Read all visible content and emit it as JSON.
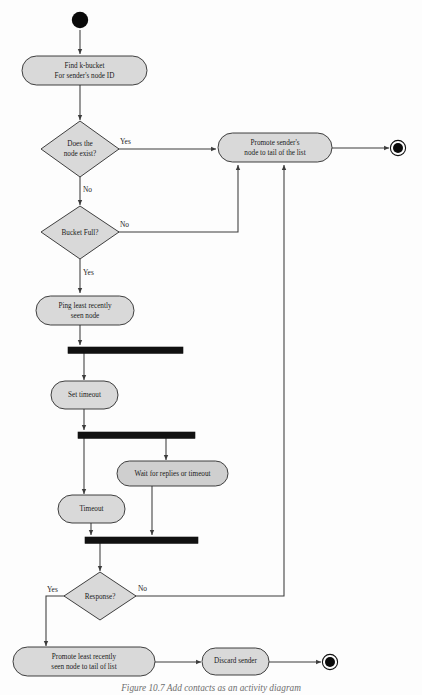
{
  "figure": {
    "caption": "Figure 10.7   Add contacts as an activity diagram"
  },
  "colors": {
    "node_fill": "#d9d9d9",
    "node_stroke": "#2b2b2b",
    "edge": "#3c3c3c",
    "bar": "#111111",
    "background": "#fdfdfd"
  },
  "nodes": {
    "start": {
      "name": "initial-node",
      "label": ""
    },
    "find_bucket": {
      "label_line1": "Find k-bucket",
      "label_line2": "For sender's node ID"
    },
    "does_node_exist": {
      "label_line1": "Does the",
      "label_line2": "node exist?"
    },
    "promote_sender": {
      "label_line1": "Promote sender's",
      "label_line2": "node to tail of the list"
    },
    "bucket_full": {
      "label": "Bucket Full?"
    },
    "ping_least_recent": {
      "label_line1": "Ping least recently",
      "label_line2": "seen node"
    },
    "set_timeout": {
      "label": "Set timeout"
    },
    "wait_for_replies": {
      "label": "Wait for replies or timeout"
    },
    "timeout": {
      "label": "Timeout"
    },
    "response": {
      "label": "Response?"
    },
    "promote_least_recent": {
      "label_line1": "Promote least recently",
      "label_line2": "seen node to tail of list"
    },
    "discard_sender": {
      "label": "Discard sender"
    },
    "end_top": {
      "name": "final-node-top",
      "label": ""
    },
    "end_bottom": {
      "name": "final-node-bottom",
      "label": ""
    }
  },
  "guards": {
    "exist_yes": "Yes",
    "exist_no": "No",
    "bucket_no": "No",
    "bucket_yes": "Yes",
    "response_yes": "Yes",
    "response_no": "No"
  },
  "flow": {
    "type": "uml-activity-diagram",
    "edges": [
      {
        "from": "start",
        "to": "find_bucket",
        "guard": ""
      },
      {
        "from": "find_bucket",
        "to": "does_node_exist",
        "guard": ""
      },
      {
        "from": "does_node_exist",
        "to": "promote_sender",
        "guard": "Yes"
      },
      {
        "from": "does_node_exist",
        "to": "bucket_full",
        "guard": "No"
      },
      {
        "from": "promote_sender",
        "to": "end_top",
        "guard": ""
      },
      {
        "from": "bucket_full",
        "to": "promote_sender",
        "guard": "No"
      },
      {
        "from": "bucket_full",
        "to": "ping_least_recent",
        "guard": "Yes"
      },
      {
        "from": "ping_least_recent",
        "to": "fork_1",
        "guard": ""
      },
      {
        "from": "fork_1",
        "to": "set_timeout",
        "guard": ""
      },
      {
        "from": "set_timeout",
        "to": "fork_2",
        "guard": ""
      },
      {
        "from": "fork_2",
        "to": "timeout",
        "guard": ""
      },
      {
        "from": "fork_2",
        "to": "wait_for_replies",
        "guard": ""
      },
      {
        "from": "timeout",
        "to": "join_1",
        "guard": ""
      },
      {
        "from": "wait_for_replies",
        "to": "join_1",
        "guard": ""
      },
      {
        "from": "join_1",
        "to": "response",
        "guard": ""
      },
      {
        "from": "response",
        "to": "promote_least_recent",
        "guard": "Yes"
      },
      {
        "from": "response",
        "to": "promote_sender",
        "guard": "No"
      },
      {
        "from": "promote_least_recent",
        "to": "discard_sender",
        "guard": ""
      },
      {
        "from": "discard_sender",
        "to": "end_bottom",
        "guard": ""
      }
    ]
  }
}
